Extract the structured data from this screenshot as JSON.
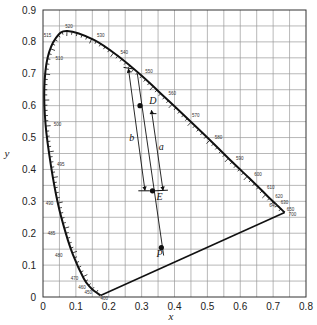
{
  "figure": {
    "type": "CIE 1931 chromaticity diagram with dominant wavelength / excitation purity construction",
    "x_axis_label": "x",
    "y_axis_label": "y",
    "x_ticks": [
      "0",
      "0.1",
      "0.2",
      "0.3",
      "0.4",
      "0.5",
      "0.6",
      "0.7",
      "0.8"
    ],
    "y_ticks": [
      "0",
      "0.1",
      "0.2",
      "0.3",
      "0.4",
      "0.5",
      "0.6",
      "0.7",
      "0.8",
      "0.9"
    ],
    "wavelength_labels": [
      "400",
      "450",
      "460",
      "470",
      "480",
      "485",
      "490",
      "495",
      "500",
      "505",
      "510",
      "515",
      "520",
      "530",
      "540",
      "550",
      "560",
      "570",
      "580",
      "590",
      "600",
      "610",
      "620",
      "630",
      "640",
      "650",
      "700"
    ],
    "point_labels": {
      "D": "D",
      "E": "E",
      "P": "P",
      "a": "a",
      "b": "b"
    }
  },
  "chart_data": {
    "type": "scatter",
    "title": "",
    "xlabel": "x",
    "ylabel": "y",
    "xlim": [
      0,
      0.8
    ],
    "ylim": [
      0,
      0.9
    ],
    "grid": true,
    "spectral_locus": [
      {
        "nm": 400,
        "x": 0.175,
        "y": 0.005
      },
      {
        "nm": 450,
        "x": 0.157,
        "y": 0.018
      },
      {
        "nm": 460,
        "x": 0.144,
        "y": 0.03
      },
      {
        "nm": 470,
        "x": 0.124,
        "y": 0.058
      },
      {
        "nm": 480,
        "x": 0.091,
        "y": 0.133
      },
      {
        "nm": 485,
        "x": 0.069,
        "y": 0.201
      },
      {
        "nm": 490,
        "x": 0.045,
        "y": 0.295
      },
      {
        "nm": 495,
        "x": 0.024,
        "y": 0.413
      },
      {
        "nm": 500,
        "x": 0.008,
        "y": 0.538
      },
      {
        "nm": 505,
        "x": 0.004,
        "y": 0.655
      },
      {
        "nm": 510,
        "x": 0.014,
        "y": 0.75
      },
      {
        "nm": 515,
        "x": 0.039,
        "y": 0.812
      },
      {
        "nm": 520,
        "x": 0.074,
        "y": 0.834
      },
      {
        "nm": 530,
        "x": 0.155,
        "y": 0.806
      },
      {
        "nm": 540,
        "x": 0.23,
        "y": 0.754
      },
      {
        "nm": 550,
        "x": 0.302,
        "y": 0.692
      },
      {
        "nm": 560,
        "x": 0.373,
        "y": 0.624
      },
      {
        "nm": 570,
        "x": 0.444,
        "y": 0.555
      },
      {
        "nm": 580,
        "x": 0.513,
        "y": 0.487
      },
      {
        "nm": 590,
        "x": 0.575,
        "y": 0.424
      },
      {
        "nm": 600,
        "x": 0.627,
        "y": 0.373
      },
      {
        "nm": 610,
        "x": 0.666,
        "y": 0.334
      },
      {
        "nm": 620,
        "x": 0.691,
        "y": 0.308
      },
      {
        "nm": 630,
        "x": 0.708,
        "y": 0.292
      },
      {
        "nm": 640,
        "x": 0.719,
        "y": 0.281
      },
      {
        "nm": 650,
        "x": 0.726,
        "y": 0.274
      },
      {
        "nm": 700,
        "x": 0.735,
        "y": 0.265
      }
    ],
    "purple_line": [
      {
        "x": 0.175,
        "y": 0.005
      },
      {
        "x": 0.735,
        "y": 0.265
      }
    ],
    "points": [
      {
        "label": "D",
        "x": 0.295,
        "y": 0.6
      },
      {
        "label": "E",
        "x": 0.333,
        "y": 0.333
      },
      {
        "label": "P",
        "x": 0.36,
        "y": 0.155
      }
    ],
    "dimension_arrows": [
      {
        "label": "b",
        "from": {
          "x": 0.26,
          "y": 0.715
        },
        "to": {
          "x": 0.31,
          "y": 0.335
        }
      },
      {
        "label": "a",
        "from": {
          "x": 0.33,
          "y": 0.585
        },
        "to": {
          "x": 0.365,
          "y": 0.335
        }
      }
    ]
  }
}
